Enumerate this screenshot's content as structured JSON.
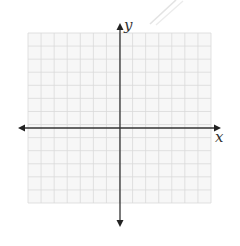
{
  "diagram": {
    "type": "coordinate-grid",
    "axes": {
      "x_label": "x",
      "y_label": "y"
    },
    "grid": {
      "columns": 14,
      "rows": 13,
      "left": 28,
      "top": 33,
      "right": 211,
      "bottom": 203
    },
    "origin": {
      "x": 120,
      "y": 128
    },
    "colors": {
      "grid_line": "#d9d9d9",
      "grid_bg": "#f7f7f7",
      "axis": "#333333",
      "stroke_faint": "#e6e6e6"
    }
  }
}
